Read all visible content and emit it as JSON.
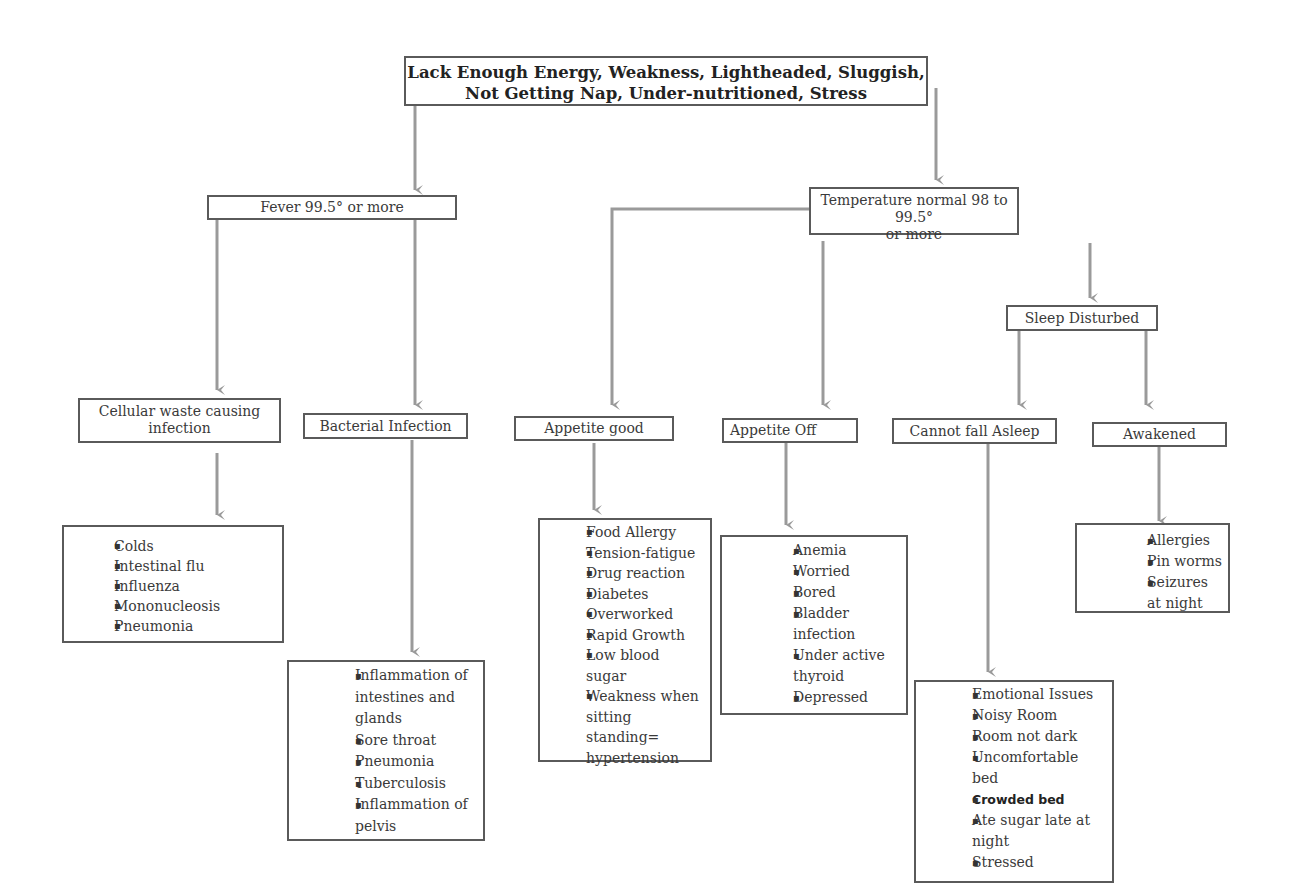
{
  "root": {
    "line1": "Lack Enough Energy, Weakness, Lightheaded, Sluggish,",
    "line2": "Not Getting Nap, Under-nutritioned, Stress"
  },
  "branches": {
    "fever": {
      "label": "Fever 99.5° or more"
    },
    "normal": {
      "line1": "Temperature normal 98 to 99.5°",
      "line2": "or more"
    },
    "sleep": {
      "label": "Sleep Disturbed"
    }
  },
  "categories": {
    "cellular": {
      "line1": "Cellular waste causing",
      "line2": "infection"
    },
    "bacterial": {
      "label": "Bacterial Infection"
    },
    "appetite_good": {
      "label": "Appetite good"
    },
    "appetite_off": {
      "label": "Appetite Off"
    },
    "cannot_sleep": {
      "label": "Cannot fall Asleep"
    },
    "awakened": {
      "label": "Awakened"
    }
  },
  "lists": {
    "cellular": [
      "Colds",
      "Intestinal flu",
      "Influenza",
      "Mononucleosis",
      "Pneumonia"
    ],
    "bacterial": [
      "Inflammation of intestines and glands",
      "Sore throat",
      "Pneumonia",
      "Tuberculosis",
      "Inflammation of pelvis"
    ],
    "appetite_good": [
      "Food Allergy",
      "Tension-fatigue",
      "Drug reaction",
      "Diabetes",
      "Overworked",
      "Rapid Growth",
      "Low blood sugar",
      "Weakness when sitting standing= hypertension"
    ],
    "appetite_off": [
      "Anemia",
      "Worried",
      "Bored",
      "Bladder infection",
      "Under active thyroid",
      "Depressed"
    ],
    "cannot_sleep": [
      "Emotional Issues",
      "Noisy Room",
      "Room not dark",
      "Uncomfortable bed",
      "Crowded bed",
      "Ate sugar late at night",
      "Stressed"
    ],
    "awakened": [
      "Allergies",
      "Pin worms",
      "Seizures at night"
    ]
  },
  "colors": {
    "connector": "#9a9a9a",
    "border": "#5a5a5a",
    "text": "#3a3a3a"
  }
}
